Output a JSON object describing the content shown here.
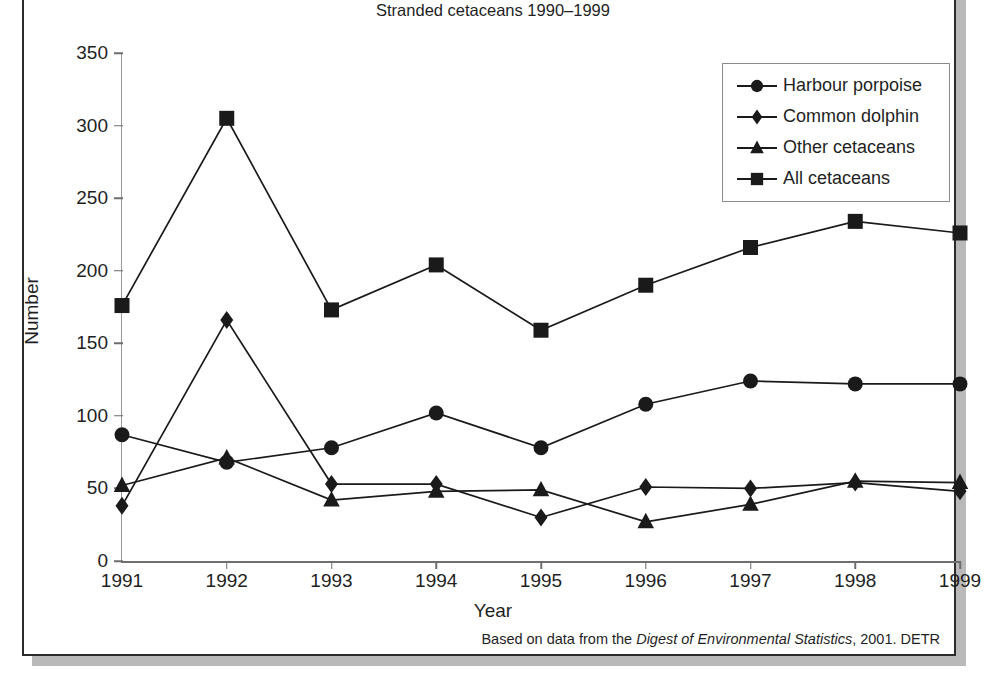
{
  "figure": {
    "top_clipped_text": "",
    "caption_prefix": "Based on data from the ",
    "caption_italic": "Digest of Environmental Statistics",
    "caption_suffix": ", 2001. DETR"
  },
  "chart_data": {
    "type": "line",
    "title": "Stranded cetaceans 1990–1999",
    "xlabel": "Year",
    "ylabel": "Number",
    "x": [
      1991,
      1992,
      1993,
      1994,
      1995,
      1996,
      1997,
      1998,
      1999
    ],
    "xtick_labels": [
      "1991",
      "1992",
      "1993",
      "1994",
      "1995",
      "1996",
      "1997",
      "1998",
      "1999"
    ],
    "ytick_labels": [
      "0",
      "50",
      "100",
      "150",
      "200",
      "250",
      "300",
      "350"
    ],
    "yticks": [
      0,
      50,
      100,
      150,
      200,
      250,
      300,
      350
    ],
    "ylim": [
      0,
      350
    ],
    "xlim": [
      1991,
      1999
    ],
    "grid": false,
    "legend_position": "upper right",
    "series": [
      {
        "name": "Harbour porpoise",
        "marker": "circle",
        "color": "#1a1a1a",
        "values": [
          87,
          68,
          78,
          102,
          78,
          108,
          124,
          122,
          122
        ]
      },
      {
        "name": "Common dolphin",
        "marker": "diamond",
        "color": "#1a1a1a",
        "values": [
          38,
          166,
          53,
          53,
          30,
          51,
          50,
          54,
          48
        ]
      },
      {
        "name": "Other cetaceans",
        "marker": "triangle",
        "color": "#1a1a1a",
        "values": [
          52,
          71,
          42,
          48,
          49,
          27,
          39,
          55,
          54
        ]
      },
      {
        "name": "All cetaceans",
        "marker": "square",
        "color": "#1a1a1a",
        "values": [
          176,
          305,
          173,
          204,
          159,
          190,
          216,
          234,
          226
        ]
      }
    ]
  }
}
